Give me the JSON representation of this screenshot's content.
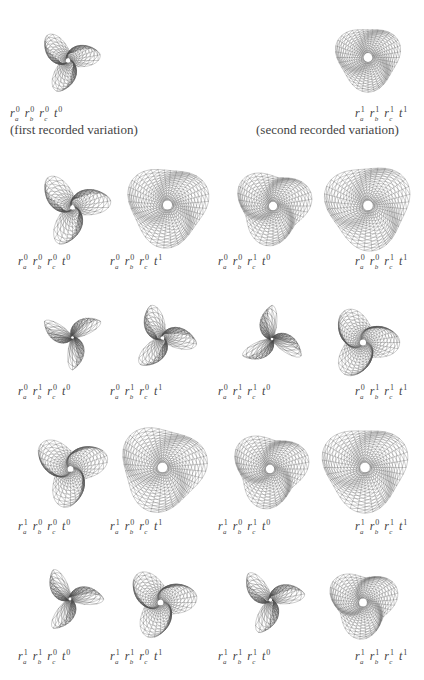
{
  "header": {
    "first": {
      "label": {
        "ra": "0",
        "rb": "0",
        "rc": "0",
        "t": "0"
      },
      "caption": "(first recorded variation)"
    },
    "second": {
      "label": {
        "ra": "1",
        "rb": "1",
        "rc": "1",
        "t": "1"
      },
      "caption": "(second recorded variation)"
    }
  },
  "figures": [
    {
      "id": "h1",
      "x": 18,
      "y": 18,
      "w": 100,
      "h": 85,
      "lobes": 3,
      "pinch": 0.35,
      "scale": 0.8,
      "rot": 30,
      "label_x": 10,
      "label_y": 107,
      "ra": "0",
      "rb": "0",
      "rc": "0",
      "t": "0"
    },
    {
      "id": "h2",
      "x": 318,
      "y": 15,
      "w": 100,
      "h": 85,
      "lobes": 3,
      "pinch": 1.0,
      "scale": 0.85,
      "rot": 10,
      "label_x": 355,
      "label_y": 107,
      "ra": "1",
      "rb": "1",
      "rc": "1",
      "t": "1"
    },
    {
      "id": "r1a",
      "x": 30,
      "y": 165,
      "w": 85,
      "h": 85,
      "lobes": 3,
      "pinch": 0.35,
      "scale": 0.95,
      "rot": 30,
      "label_x": 18,
      "label_y": 255,
      "ra": "0",
      "rb": "0",
      "rc": "0",
      "t": "0"
    },
    {
      "id": "r1b",
      "x": 120,
      "y": 160,
      "w": 95,
      "h": 90,
      "lobes": 3,
      "pinch": 1.0,
      "scale": 1.0,
      "rot": 15,
      "label_x": 110,
      "label_y": 255,
      "ra": "0",
      "rb": "0",
      "rc": "0",
      "t": "1"
    },
    {
      "id": "r1c",
      "x": 228,
      "y": 162,
      "w": 90,
      "h": 88,
      "lobes": 3,
      "pinch": 0.9,
      "scale": 0.95,
      "rot": 20,
      "label_x": 218,
      "label_y": 255,
      "ra": "0",
      "rb": "0",
      "rc": "1",
      "t": "0"
    },
    {
      "id": "r1d",
      "x": 318,
      "y": 158,
      "w": 100,
      "h": 95,
      "lobes": 3,
      "pinch": 1.0,
      "scale": 1.0,
      "rot": 5,
      "label_x": 355,
      "label_y": 255,
      "ra": "0",
      "rb": "0",
      "rc": "1",
      "t": "1"
    },
    {
      "id": "r2a",
      "x": 30,
      "y": 300,
      "w": 85,
      "h": 75,
      "lobes": 3,
      "pinch": 0.12,
      "scale": 0.9,
      "rot": 10,
      "label_x": 18,
      "label_y": 385,
      "ra": "0",
      "rb": "1",
      "rc": "0",
      "t": "0"
    },
    {
      "id": "r2b",
      "x": 120,
      "y": 298,
      "w": 85,
      "h": 80,
      "lobes": 3,
      "pinch": 0.25,
      "scale": 0.9,
      "rot": 50,
      "label_x": 110,
      "label_y": 385,
      "ra": "0",
      "rb": "1",
      "rc": "0",
      "t": "1"
    },
    {
      "id": "r2c",
      "x": 232,
      "y": 300,
      "w": 80,
      "h": 78,
      "lobes": 3,
      "pinch": 0.12,
      "scale": 0.9,
      "rot": 70,
      "label_x": 218,
      "label_y": 385,
      "ra": "0",
      "rb": "1",
      "rc": "1",
      "t": "0"
    },
    {
      "id": "r2d",
      "x": 318,
      "y": 300,
      "w": 90,
      "h": 85,
      "lobes": 3,
      "pinch": 0.6,
      "scale": 0.9,
      "rot": 40,
      "label_x": 355,
      "label_y": 385,
      "ra": "0",
      "rb": "1",
      "rc": "1",
      "t": "1"
    },
    {
      "id": "r3a",
      "x": 28,
      "y": 425,
      "w": 85,
      "h": 88,
      "lobes": 3,
      "pinch": 0.55,
      "scale": 0.95,
      "rot": 20,
      "label_x": 18,
      "label_y": 520,
      "ra": "1",
      "rb": "0",
      "rc": "0",
      "t": "0"
    },
    {
      "id": "r3b",
      "x": 115,
      "y": 420,
      "w": 95,
      "h": 95,
      "lobes": 3,
      "pinch": 1.0,
      "scale": 1.0,
      "rot": 25,
      "label_x": 110,
      "label_y": 520,
      "ra": "1",
      "rb": "0",
      "rc": "0",
      "t": "1"
    },
    {
      "id": "r3c",
      "x": 225,
      "y": 425,
      "w": 90,
      "h": 88,
      "lobes": 3,
      "pinch": 0.9,
      "scale": 0.95,
      "rot": 20,
      "label_x": 218,
      "label_y": 520,
      "ra": "1",
      "rb": "0",
      "rc": "1",
      "t": "0"
    },
    {
      "id": "r3d",
      "x": 315,
      "y": 420,
      "w": 100,
      "h": 95,
      "lobes": 3,
      "pinch": 1.0,
      "scale": 1.0,
      "rot": 10,
      "label_x": 355,
      "label_y": 520,
      "ra": "1",
      "rb": "0",
      "rc": "1",
      "t": "1"
    },
    {
      "id": "r4a",
      "x": 30,
      "y": 560,
      "w": 80,
      "h": 78,
      "lobes": 3,
      "pinch": 0.15,
      "scale": 0.9,
      "rot": 40,
      "label_x": 18,
      "label_y": 650,
      "ra": "1",
      "rb": "1",
      "rc": "0",
      "t": "0"
    },
    {
      "id": "r4b",
      "x": 118,
      "y": 560,
      "w": 85,
      "h": 85,
      "lobes": 3,
      "pinch": 0.55,
      "scale": 0.9,
      "rot": 30,
      "label_x": 110,
      "label_y": 650,
      "ra": "1",
      "rb": "1",
      "rc": "0",
      "t": "1"
    },
    {
      "id": "r4c",
      "x": 228,
      "y": 560,
      "w": 85,
      "h": 80,
      "lobes": 3,
      "pinch": 0.2,
      "scale": 0.9,
      "rot": 30,
      "label_x": 218,
      "label_y": 650,
      "ra": "1",
      "rb": "1",
      "rc": "1",
      "t": "0"
    },
    {
      "id": "r4d",
      "x": 318,
      "y": 560,
      "w": 90,
      "h": 85,
      "lobes": 3,
      "pinch": 0.85,
      "scale": 0.9,
      "rot": 15,
      "label_x": 355,
      "label_y": 650,
      "ra": "1",
      "rb": "1",
      "rc": "1",
      "t": "1"
    }
  ],
  "symbols": {
    "r": "r",
    "t": "t",
    "sub_a": "a",
    "sub_b": "b",
    "sub_c": "c"
  },
  "colors": {
    "stroke": "#555555",
    "text": "#444444",
    "background": "#ffffff"
  }
}
